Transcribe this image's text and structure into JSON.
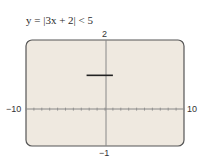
{
  "chart_data": {
    "type": "line",
    "title": "y = |3x + 2| < 5",
    "xlabel": "",
    "ylabel": "",
    "xlim": [
      -10,
      10
    ],
    "ylim": [
      -1,
      2
    ],
    "x_tick_step": 1,
    "grid": false,
    "tick_labels": {
      "xmin": "−10",
      "xmax": "10",
      "ymax": "2",
      "ymin": "−1"
    },
    "series": [
      {
        "name": "y = |3x + 2| < 5",
        "x": [
          -2.333,
          1
        ],
        "y": [
          1,
          1
        ]
      }
    ],
    "background_color": "#efe9e0",
    "frame_color": "#555555",
    "line_color": "#222222"
  }
}
